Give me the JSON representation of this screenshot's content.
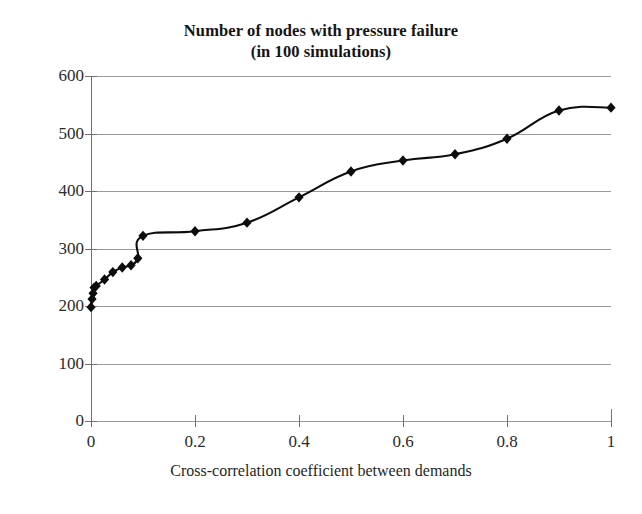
{
  "chart_data": {
    "type": "line",
    "title": "Number of nodes with pressure failure",
    "subtitle": "(in 100 simulations)",
    "xlabel": "Cross-correlation coefficient between demands",
    "ylabel": "",
    "xlim": [
      0,
      1
    ],
    "ylim": [
      0,
      600
    ],
    "xticks": [
      "0",
      "0.2",
      "0.4",
      "0.6",
      "0.8",
      "1"
    ],
    "xtick_values": [
      0,
      0.2,
      0.4,
      0.6,
      0.8,
      1
    ],
    "yticks": [
      "0",
      "100",
      "200",
      "300",
      "400",
      "500",
      "600"
    ],
    "ytick_values": [
      0,
      100,
      200,
      300,
      400,
      500,
      600
    ],
    "grid": "horizontal",
    "legend": "none",
    "marker": "diamond",
    "series": [
      {
        "name": "Number of nodes with pressure failure",
        "points": [
          {
            "x": 0.0,
            "y": 198
          },
          {
            "x": 0.002,
            "y": 212
          },
          {
            "x": 0.004,
            "y": 222
          },
          {
            "x": 0.006,
            "y": 232
          },
          {
            "x": 0.01,
            "y": 235
          },
          {
            "x": 0.026,
            "y": 246
          },
          {
            "x": 0.042,
            "y": 259
          },
          {
            "x": 0.06,
            "y": 267
          },
          {
            "x": 0.077,
            "y": 271
          },
          {
            "x": 0.09,
            "y": 283
          },
          {
            "x": 0.1,
            "y": 322
          },
          {
            "x": 0.2,
            "y": 330
          },
          {
            "x": 0.3,
            "y": 345
          },
          {
            "x": 0.4,
            "y": 389
          },
          {
            "x": 0.5,
            "y": 434
          },
          {
            "x": 0.6,
            "y": 453
          },
          {
            "x": 0.7,
            "y": 464
          },
          {
            "x": 0.8,
            "y": 491
          },
          {
            "x": 0.9,
            "y": 540
          },
          {
            "x": 1.0,
            "y": 545
          }
        ]
      }
    ]
  }
}
